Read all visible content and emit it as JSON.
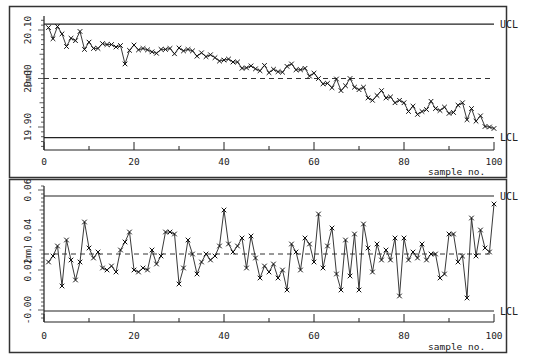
{
  "chart_data": [
    {
      "type": "line",
      "title": "",
      "xlabel": "sample no.",
      "ylabel": "[mm]",
      "xlim": [
        0,
        100
      ],
      "ylim": [
        19.855,
        20.135
      ],
      "x_ticks": [
        0,
        20,
        40,
        60,
        80,
        100
      ],
      "x_tick_labels": [
        "0",
        "20",
        "40",
        "60",
        "80",
        "100"
      ],
      "y_ticks": [
        19.9,
        20.0,
        20.1
      ],
      "y_tick_labels": [
        "19.90",
        "20.00",
        "20.10"
      ],
      "control_limits": {
        "UCL": 20.112,
        "CL": 20.0,
        "LCL": 19.878
      },
      "limit_labels": {
        "ucl": "UCL",
        "lcl": "LCL"
      },
      "grid": false,
      "legend": null,
      "marker": "x",
      "series": [
        {
          "name": "sample mean",
          "x": [
            1,
            2,
            3,
            4,
            5,
            6,
            7,
            8,
            9,
            10,
            11,
            12,
            13,
            14,
            15,
            16,
            17,
            18,
            19,
            20,
            21,
            22,
            23,
            24,
            25,
            26,
            27,
            28,
            29,
            30,
            31,
            32,
            33,
            34,
            35,
            36,
            37,
            38,
            39,
            40,
            41,
            42,
            43,
            44,
            45,
            46,
            47,
            48,
            49,
            50,
            51,
            52,
            53,
            54,
            55,
            56,
            57,
            58,
            59,
            60,
            61,
            62,
            63,
            64,
            65,
            66,
            67,
            68,
            69,
            70,
            71,
            72,
            73,
            74,
            75,
            76,
            77,
            78,
            79,
            80,
            81,
            82,
            83,
            84,
            85,
            86,
            87,
            88,
            89,
            90,
            91,
            92,
            93,
            94,
            95,
            96,
            97,
            98,
            99,
            100
          ],
          "values": [
            20.105,
            20.082,
            20.107,
            20.092,
            20.066,
            20.083,
            20.078,
            20.097,
            20.06,
            20.075,
            20.062,
            20.062,
            20.072,
            20.07,
            20.07,
            20.065,
            20.068,
            20.03,
            20.058,
            20.069,
            20.059,
            20.062,
            20.059,
            20.055,
            20.052,
            20.06,
            20.06,
            20.062,
            20.051,
            20.063,
            20.057,
            20.06,
            20.057,
            20.046,
            20.053,
            20.045,
            20.049,
            20.043,
            20.036,
            20.038,
            20.04,
            20.034,
            20.034,
            20.021,
            20.022,
            20.026,
            20.02,
            20.016,
            20.027,
            20.012,
            20.019,
            20.014,
            20.013,
            20.025,
            20.03,
            20.018,
            20.018,
            20.021,
            20.005,
            20.011,
            20.0,
            19.989,
            19.99,
            19.981,
            19.999,
            19.975,
            19.985,
            20.0,
            19.982,
            19.977,
            19.982,
            19.96,
            19.955,
            19.965,
            19.975,
            19.96,
            19.962,
            19.95,
            19.955,
            19.95,
            19.932,
            19.943,
            19.926,
            19.932,
            19.936,
            19.953,
            19.938,
            19.934,
            19.941,
            19.928,
            19.93,
            19.945,
            19.95,
            19.915,
            19.938,
            19.912,
            19.923,
            19.901,
            19.9,
            19.897
          ]
        }
      ]
    },
    {
      "type": "line",
      "title": "",
      "xlabel": "sample no.",
      "ylabel": "[mm]",
      "xlim": [
        0,
        100
      ],
      "ylim": [
        -0.006,
        0.066
      ],
      "x_ticks": [
        0,
        20,
        40,
        60,
        80,
        100
      ],
      "x_tick_labels": [
        "0",
        "20",
        "40",
        "60",
        "80",
        "100"
      ],
      "y_ticks": [
        0.0,
        0.02,
        0.04,
        0.06
      ],
      "y_tick_labels": [
        "-0.00",
        "0.02",
        "0.04",
        "0.06"
      ],
      "control_limits": {
        "UCL": 0.057,
        "CL": 0.028,
        "LCL": -0.0005
      },
      "limit_labels": {
        "ucl": "UCL",
        "lcl": "LCL"
      },
      "grid": false,
      "legend": null,
      "marker": "x",
      "series": [
        {
          "name": "sample range",
          "x": [
            1,
            2,
            3,
            4,
            5,
            6,
            7,
            8,
            9,
            10,
            11,
            12,
            13,
            14,
            15,
            16,
            17,
            18,
            19,
            20,
            21,
            22,
            23,
            24,
            25,
            26,
            27,
            28,
            29,
            30,
            31,
            32,
            33,
            34,
            35,
            36,
            37,
            38,
            39,
            40,
            41,
            42,
            43,
            44,
            45,
            46,
            47,
            48,
            49,
            50,
            51,
            52,
            53,
            54,
            55,
            56,
            57,
            58,
            59,
            60,
            61,
            62,
            63,
            64,
            65,
            66,
            67,
            68,
            69,
            70,
            71,
            72,
            73,
            74,
            75,
            76,
            77,
            78,
            79,
            80,
            81,
            82,
            83,
            84,
            85,
            86,
            87,
            88,
            89,
            90,
            91,
            92,
            93,
            94,
            95,
            96,
            97,
            98,
            99,
            100
          ],
          "values": [
            0.024,
            0.027,
            0.032,
            0.012,
            0.035,
            0.025,
            0.015,
            0.024,
            0.044,
            0.031,
            0.026,
            0.029,
            0.021,
            0.02,
            0.022,
            0.019,
            0.03,
            0.034,
            0.039,
            0.02,
            0.019,
            0.021,
            0.02,
            0.03,
            0.023,
            0.027,
            0.039,
            0.039,
            0.038,
            0.013,
            0.021,
            0.035,
            0.028,
            0.018,
            0.024,
            0.028,
            0.025,
            0.027,
            0.032,
            0.05,
            0.033,
            0.029,
            0.032,
            0.036,
            0.021,
            0.037,
            0.026,
            0.016,
            0.022,
            0.019,
            0.023,
            0.016,
            0.02,
            0.01,
            0.033,
            0.029,
            0.02,
            0.036,
            0.033,
            0.024,
            0.048,
            0.021,
            0.032,
            0.041,
            0.018,
            0.01,
            0.035,
            0.017,
            0.038,
            0.01,
            0.043,
            0.031,
            0.019,
            0.033,
            0.025,
            0.03,
            0.025,
            0.036,
            0.007,
            0.036,
            0.025,
            0.029,
            0.026,
            0.033,
            0.025,
            0.028,
            0.028,
            0.016,
            0.018,
            0.038,
            0.038,
            0.024,
            0.027,
            0.006,
            0.046,
            0.027,
            0.04,
            0.031,
            0.029,
            0.053
          ]
        }
      ]
    }
  ]
}
